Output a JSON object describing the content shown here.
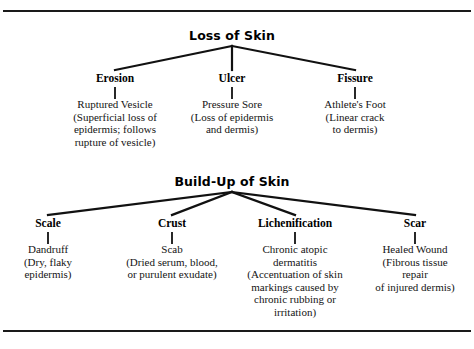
{
  "document": {
    "top_rule": "horizontal-rule",
    "bottom_rule": "horizontal-rule"
  },
  "trees": [
    {
      "title": "Loss of Skin",
      "nodes": [
        {
          "label": "Erosion",
          "description": "Ruptured Vesicle\n(Superficial loss of\nepidermis; follows\nrupture of vesicle)"
        },
        {
          "label": "Ulcer",
          "description": "Pressure Sore\n(Loss of epidermis\nand dermis)"
        },
        {
          "label": "Fissure",
          "description": "Athlete's Foot\n(Linear crack\nto dermis)"
        }
      ]
    },
    {
      "title": "Build-Up of Skin",
      "nodes": [
        {
          "label": "Scale",
          "description": "Dandruff\n(Dry, flaky\nepidermis)"
        },
        {
          "label": "Crust",
          "description": "Scab\n(Dried serum, blood,\nor purulent exudate)"
        },
        {
          "label": "Lichenification",
          "description": "Chronic atopic\ndermatitis\n(Accentuation of skin\nmarkings caused by\nchronic rubbing or\nirritation)"
        },
        {
          "label": "Scar",
          "description": "Healed Wound\n(Fibrous tissue\nrepair\nof injured dermis)"
        }
      ]
    }
  ],
  "colors": {
    "ink": "#111111",
    "rule": "#1a1a1a",
    "background": "#ffffff"
  }
}
